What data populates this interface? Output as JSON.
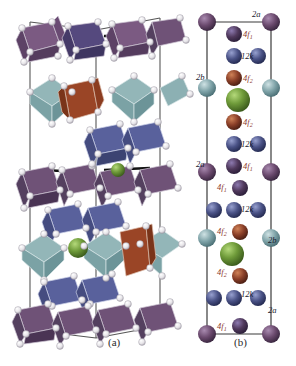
{
  "figure": {
    "panel_a": {
      "caption": "(a)",
      "description": "polyhedral-crystal-structure"
    },
    "panel_b": {
      "caption": "(b)",
      "description": "unit-cell-site-labels"
    }
  },
  "colors": {
    "purple": "#6b4a6e",
    "purple_dark": "#50395c",
    "blue": "#4a5286",
    "blue_light": "#6670a8",
    "teal": "#7fa3a8",
    "teal_light": "#9dc0c3",
    "brown": "#8a3f28",
    "brown_light": "#b4623c",
    "green": "#6f9b3a",
    "green_light": "#8fbc52",
    "oxygen": "#e8e6ea",
    "bond": "#4a4a4a",
    "label_red": "#8d3a2e",
    "label_dark": "#1a1a2e",
    "poly_purple": "#6f5277",
    "poly_blue": "#4e5a92",
    "poly_teal": "#8fb3b5",
    "poly_brown": "#8e4026"
  },
  "panel_b_labels": [
    {
      "id": "t-2a-top",
      "text": "2a",
      "sub": "",
      "style": "dark",
      "x": 252,
      "y": 10
    },
    {
      "id": "t-4f1-1",
      "text": "4f",
      "sub": "1",
      "style": "red",
      "x": 243,
      "y": 30
    },
    {
      "id": "t-12k-1",
      "text": "12k",
      "sub": "",
      "style": "dark",
      "x": 241,
      "y": 52
    },
    {
      "id": "t-2b-left",
      "text": "2b",
      "sub": "",
      "style": "dark",
      "x": 196,
      "y": 73
    },
    {
      "id": "t-4f2-1",
      "text": "4f",
      "sub": "2",
      "style": "red",
      "x": 243,
      "y": 74
    },
    {
      "id": "t-4f2-2",
      "text": "4f",
      "sub": "2",
      "style": "red",
      "x": 243,
      "y": 118
    },
    {
      "id": "t-12k-2",
      "text": "12k",
      "sub": "",
      "style": "dark",
      "x": 241,
      "y": 140
    },
    {
      "id": "t-2a-left",
      "text": "2a",
      "sub": "",
      "style": "dark",
      "x": 196,
      "y": 160
    },
    {
      "id": "t-4f1-2",
      "text": "4f",
      "sub": "1",
      "style": "red",
      "x": 243,
      "y": 162
    },
    {
      "id": "t-4f1-3",
      "text": "4f",
      "sub": "1",
      "style": "red",
      "x": 217,
      "y": 183
    },
    {
      "id": "t-12k-3",
      "text": "12k",
      "sub": "",
      "style": "dark",
      "x": 241,
      "y": 205
    },
    {
      "id": "t-4f2-3",
      "text": "4f",
      "sub": "2",
      "style": "red",
      "x": 217,
      "y": 227
    },
    {
      "id": "t-2b-right",
      "text": "2b",
      "sub": "",
      "style": "dark",
      "x": 268,
      "y": 236
    },
    {
      "id": "t-4f2-4",
      "text": "4f",
      "sub": "2",
      "style": "red",
      "x": 217,
      "y": 268
    },
    {
      "id": "t-12k-4",
      "text": "12k",
      "sub": "",
      "style": "dark",
      "x": 241,
      "y": 290
    },
    {
      "id": "t-2a-right",
      "text": "2a",
      "sub": "",
      "style": "dark",
      "x": 268,
      "y": 306
    },
    {
      "id": "t-4f1-4",
      "text": "4f",
      "sub": "1",
      "style": "red",
      "x": 217,
      "y": 322
    }
  ],
  "panel_b_atoms": {
    "left_column": [
      {
        "y": 22,
        "color": "purple",
        "r": 9
      },
      {
        "y": 88,
        "color": "teal",
        "r": 9
      },
      {
        "y": 172,
        "color": "purple",
        "r": 9
      },
      {
        "y": 238,
        "color": "teal",
        "r": 9
      },
      {
        "y": 334,
        "color": "purple",
        "r": 9
      }
    ],
    "right_column": [
      {
        "y": 22,
        "color": "purple",
        "r": 9
      },
      {
        "y": 88,
        "color": "teal",
        "r": 9
      },
      {
        "y": 172,
        "color": "purple",
        "r": 9
      },
      {
        "y": 238,
        "color": "teal",
        "r": 9
      },
      {
        "y": 334,
        "color": "purple",
        "r": 9
      }
    ],
    "center_column": [
      {
        "y": 34,
        "color": "purple_dark",
        "r": 8,
        "site": "4f1"
      },
      {
        "y": 56,
        "color": "blue",
        "r": 8,
        "site": "12k"
      },
      {
        "y": 78,
        "color": "brown",
        "r": 8,
        "site": "4f2"
      },
      {
        "y": 100,
        "color": "green",
        "r": 12,
        "site": "2b"
      },
      {
        "y": 122,
        "color": "brown",
        "r": 8,
        "site": "4f2"
      },
      {
        "y": 144,
        "color": "blue",
        "r": 8,
        "site": "12k"
      },
      {
        "y": 166,
        "color": "purple_dark",
        "r": 8,
        "site": "4f1"
      },
      {
        "y": 188,
        "color": "purple_dark",
        "r": 8,
        "site": "4f1"
      },
      {
        "y": 210,
        "color": "blue",
        "r": 8,
        "site": "12k"
      },
      {
        "y": 232,
        "color": "brown",
        "r": 8,
        "site": "4f2"
      },
      {
        "y": 254,
        "color": "green",
        "r": 12,
        "site": "2b"
      },
      {
        "y": 276,
        "color": "brown",
        "r": 8,
        "site": "4f2"
      },
      {
        "y": 298,
        "color": "blue",
        "r": 8,
        "site": "12k"
      },
      {
        "y": 326,
        "color": "purple_dark",
        "r": 8,
        "site": "4f1"
      }
    ],
    "side_column": [
      {
        "y": 56,
        "color": "blue",
        "r": 8
      },
      {
        "y": 144,
        "color": "blue",
        "r": 8
      },
      {
        "y": 210,
        "color": "blue",
        "r": 8
      },
      {
        "y": 298,
        "color": "blue",
        "r": 8
      }
    ]
  }
}
